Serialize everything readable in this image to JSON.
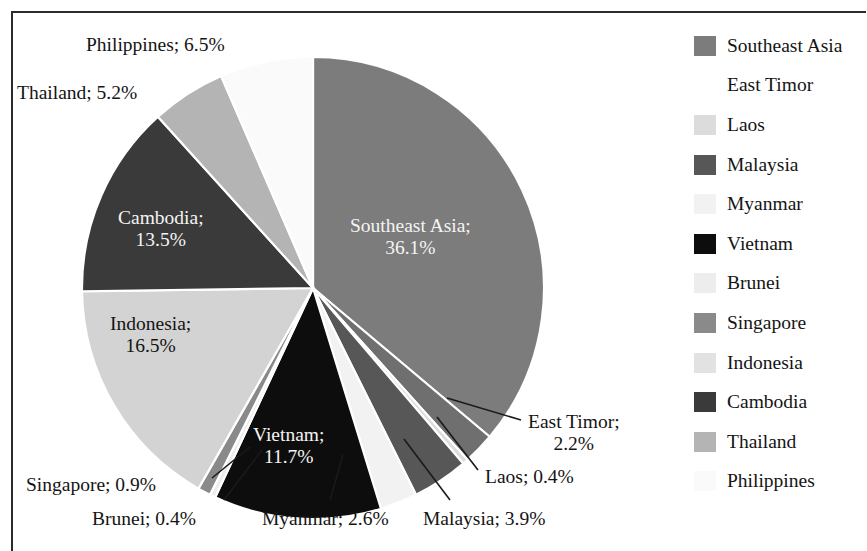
{
  "chart_data": {
    "type": "pie",
    "title": "",
    "start_angle_deg": 0,
    "direction": "clockwise",
    "center": {
      "x": 313,
      "y": 288
    },
    "radius": 231,
    "value_unit": "%",
    "categories": [
      "Southeast Asia",
      "East Timor",
      "Laos",
      "Malaysia",
      "Myanmar",
      "Vietnam",
      "Brunei",
      "Singapore",
      "Indonesia",
      "Cambodia",
      "Thailand",
      "Philippines"
    ],
    "values": [
      36.1,
      2.2,
      0.4,
      3.9,
      2.6,
      11.7,
      0.4,
      0.9,
      16.5,
      13.5,
      5.2,
      6.5
    ],
    "colors": [
      "#7c7c7c",
      "#6f6f6f",
      "#dcdcdc",
      "#575757",
      "#f2f2f2",
      "#0d0d0d",
      "#ededed",
      "#8a8a8a",
      "#d3d3d3",
      "#3a3a3a",
      "#b4b4b4",
      "#fafafa"
    ],
    "slices": [
      {
        "label": "Southeast Asia",
        "value": 36.1,
        "text": "Southeast Asia;\n36.1%",
        "color": "#7c7c7c",
        "label_placement": "inside",
        "text_color": "light"
      },
      {
        "label": "East Timor",
        "value": 2.2,
        "text": "East Timor;\n2.2%",
        "color": "#6f6f6f",
        "label_placement": "outside",
        "text_color": "dark"
      },
      {
        "label": "Laos",
        "value": 0.4,
        "text": "Laos; 0.4%",
        "color": "#dcdcdc",
        "label_placement": "outside",
        "text_color": "dark"
      },
      {
        "label": "Malaysia",
        "value": 3.9,
        "text": "Malaysia; 3.9%",
        "color": "#575757",
        "label_placement": "outside",
        "text_color": "dark"
      },
      {
        "label": "Myanmar",
        "value": 2.6,
        "text": "Myanmar; 2.6%",
        "color": "#f2f2f2",
        "label_placement": "outside",
        "text_color": "dark"
      },
      {
        "label": "Vietnam",
        "value": 11.7,
        "text": "Vietnam;\n11.7%",
        "color": "#0d0d0d",
        "label_placement": "inside",
        "text_color": "light"
      },
      {
        "label": "Brunei",
        "value": 0.4,
        "text": "Brunei; 0.4%",
        "color": "#ededed",
        "label_placement": "outside",
        "text_color": "dark"
      },
      {
        "label": "Singapore",
        "value": 0.9,
        "text": "Singapore; 0.9%",
        "color": "#8a8a8a",
        "label_placement": "outside",
        "text_color": "dark"
      },
      {
        "label": "Indonesia",
        "value": 16.5,
        "text": "Indonesia;\n16.5%",
        "color": "#d3d3d3",
        "label_placement": "inside",
        "text_color": "dark"
      },
      {
        "label": "Cambodia",
        "value": 13.5,
        "text": "Cambodia;\n13.5%",
        "color": "#3a3a3a",
        "label_placement": "inside",
        "text_color": "light"
      },
      {
        "label": "Thailand",
        "value": 5.2,
        "text": "Thailand; 5.2%",
        "color": "#b4b4b4",
        "label_placement": "outside",
        "text_color": "dark"
      },
      {
        "label": "Philippines",
        "value": 6.5,
        "text": "Philippines; 6.5%",
        "color": "#fafafa",
        "label_placement": "outside",
        "text_color": "dark"
      }
    ],
    "legend": {
      "position": "right",
      "entries": [
        {
          "label": "Southeast Asia",
          "color": "#7c7c7c"
        },
        {
          "label": "East Timor",
          "color": "#ffffff"
        },
        {
          "label": "Laos",
          "color": "#dcdcdc"
        },
        {
          "label": "Malaysia",
          "color": "#575757"
        },
        {
          "label": "Myanmar",
          "color": "#f2f2f2"
        },
        {
          "label": "Vietnam",
          "color": "#0d0d0d"
        },
        {
          "label": "Brunei",
          "color": "#ededed"
        },
        {
          "label": "Singapore",
          "color": "#8a8a8a"
        },
        {
          "label": "Indonesia",
          "color": "#e2e2e2"
        },
        {
          "label": "Cambodia",
          "color": "#3a3a3a"
        },
        {
          "label": "Thailand",
          "color": "#b4b4b4"
        },
        {
          "label": "Philippines",
          "color": "#fafafa"
        }
      ]
    },
    "callout_labels": [
      {
        "label": "Philippines",
        "text": "Philippines; 6.5%",
        "x": 86,
        "y": 34
      },
      {
        "label": "Thailand",
        "text": "Thailand; 5.2%",
        "x": 17,
        "y": 82
      },
      {
        "label": "East Timor",
        "text": "East Timor;\n2.2%",
        "x": 528,
        "y": 411
      },
      {
        "label": "Laos",
        "text": "Laos; 0.4%",
        "x": 485,
        "y": 466
      },
      {
        "label": "Malaysia",
        "text": "Malaysia; 3.9%",
        "x": 423,
        "y": 508
      },
      {
        "label": "Myanmar",
        "text": "Myanmar; 2.6%",
        "x": 262,
        "y": 508
      },
      {
        "label": "Brunei",
        "text": "Brunei; 0.4%",
        "x": 92,
        "y": 508
      },
      {
        "label": "Singapore",
        "text": "Singapore; 0.9%",
        "x": 26,
        "y": 474
      }
    ],
    "inside_labels": [
      {
        "label": "Southeast Asia",
        "text": "Southeast Asia;\n36.1%",
        "x": 350,
        "y": 215
      },
      {
        "label": "Cambodia",
        "text": "Cambodia;\n13.5%",
        "x": 118,
        "y": 207
      },
      {
        "label": "Indonesia",
        "text": "Indonesia;\n16.5%",
        "x": 110,
        "y": 313
      },
      {
        "label": "Vietnam",
        "text": "Vietnam;\n11.7%",
        "x": 253,
        "y": 424
      }
    ],
    "leader_lines": [
      {
        "label": "East Timor",
        "x1": 447,
        "y1": 398,
        "x2": 521,
        "y2": 420
      },
      {
        "label": "Laos",
        "x1": 437,
        "y1": 417,
        "x2": 478,
        "y2": 470
      },
      {
        "label": "Malaysia",
        "x1": 404,
        "y1": 439,
        "x2": 450,
        "y2": 500
      },
      {
        "label": "Myanmar",
        "x1": 343,
        "y1": 455,
        "x2": 330,
        "y2": 500
      },
      {
        "label": "Brunei",
        "x1": 262,
        "y1": 450,
        "x2": 224,
        "y2": 500
      },
      {
        "label": "Singapore",
        "x1": 250,
        "y1": 447,
        "x2": 212,
        "y2": 478
      }
    ]
  }
}
